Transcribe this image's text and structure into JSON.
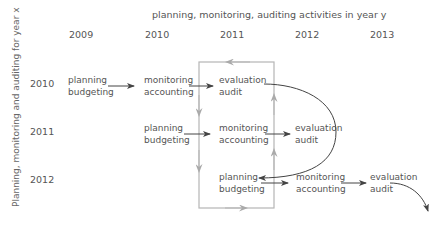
{
  "diagram": {
    "title_top": "planning, monitoring, auditing activities in year y",
    "title_left": "Planning, monitoring and auditing  for year x",
    "columns": [
      "2009",
      "2010",
      "2011",
      "2012",
      "2013"
    ],
    "rows": [
      "2010",
      "2011",
      "2012"
    ],
    "nodes": {
      "r2010": [
        {
          "line1": "planning",
          "line2": "budgeting"
        },
        {
          "line1": "monitoring",
          "line2": "accounting"
        },
        {
          "line1": "evaluation",
          "line2": "audit"
        }
      ],
      "r2011": [
        {
          "line1": "planning",
          "line2": "budgeting"
        },
        {
          "line1": "monitoring",
          "line2": "accounting"
        },
        {
          "line1": "evaluation",
          "line2": "audit"
        }
      ],
      "r2012": [
        {
          "line1": "planning",
          "line2": "budgeting"
        },
        {
          "line1": "monitoring",
          "line2": "accounting"
        },
        {
          "line1": "evaluation",
          "line2": "audit"
        }
      ]
    },
    "colors": {
      "text": "#555555",
      "arrow_dark": "#444444",
      "box_gray": "#b0b0b0"
    }
  }
}
